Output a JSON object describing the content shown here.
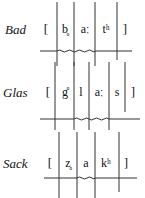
{
  "panels": [
    {
      "word": "Bad",
      "open_bracket": "[",
      "close_bracket": "]",
      "segments": [
        "b̥",
        "aː",
        "tʰ"
      ]
    },
    {
      "word": "Glas",
      "open_bracket": "[",
      "close_bracket": "]",
      "segments": [
        "g̊",
        "l",
        "aː",
        "s"
      ]
    },
    {
      "word": "Sack",
      "open_bracket": "[",
      "close_bracket": "]",
      "segments": [
        "z̥",
        "a",
        "kʰ"
      ]
    }
  ]
}
